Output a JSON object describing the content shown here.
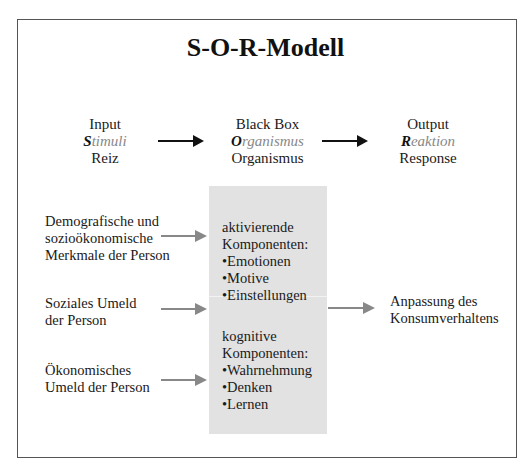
{
  "title": "S-O-R-Modell",
  "columns": [
    {
      "line1": "Input",
      "accent_letter": "S",
      "accent_rest": "timuli",
      "line3": "Reiz"
    },
    {
      "line1": "Black Box",
      "accent_letter": "O",
      "accent_rest": "rganismus",
      "line3": "Organismus"
    },
    {
      "line1": "Output",
      "accent_letter": "R",
      "accent_rest": "eaktion",
      "line3": "Response"
    }
  ],
  "inputs": [
    {
      "lines": [
        "Demografische und",
        "sozioökonomische",
        "Merkmale der Person"
      ]
    },
    {
      "lines": [
        "Soziales Umeld",
        "der Person"
      ]
    },
    {
      "lines": [
        "Ökonomisches",
        "Umeld der Person"
      ]
    }
  ],
  "organism": {
    "activating": {
      "heading1": "aktivierende",
      "heading2": "Komponenten:",
      "items": [
        "Emotionen",
        "Motive",
        "Einstellungen"
      ]
    },
    "cognitive": {
      "heading1": "kognitive",
      "heading2": "Komponenten:",
      "items": [
        "Wahrnehmung",
        "Denken",
        "Lernen"
      ]
    }
  },
  "output": {
    "lines": [
      "Anpassung des",
      "Konsumverhaltens"
    ]
  },
  "colors": {
    "box_fill": "#e2e2e2",
    "arrow_grey": "#888888",
    "arrow_black": "#111111",
    "accent_grey": "#888888"
  }
}
